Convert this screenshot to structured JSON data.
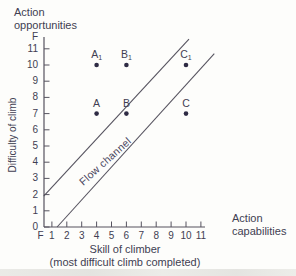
{
  "figure": {
    "top_label_line1": "Action",
    "top_label_line2": "opportunities",
    "right_label_line1": "Action",
    "right_label_line2": "capabilities",
    "y_axis_label": "Difficulty of climb",
    "x_axis_label_line1": "Skill of climber",
    "x_axis_label_line2": "(most difficult climb completed)"
  },
  "chart_data": {
    "type": "scatter",
    "title": "",
    "xlabel": "Skill of climber (most difficult climb completed)",
    "ylabel": "Difficulty of climb",
    "xlim": [
      0,
      12
    ],
    "ylim": [
      0,
      12
    ],
    "grid": false,
    "x_ticks": [
      "F",
      "1",
      "2",
      "3",
      "4",
      "5",
      "6",
      "7",
      "8",
      "9",
      "10",
      "11"
    ],
    "y_ticks": [
      "F",
      "11",
      "10",
      "9",
      "8",
      "7",
      "6",
      "5",
      "4",
      "3",
      "2",
      "1",
      "0"
    ],
    "points": [
      {
        "label": "A",
        "sub": "1",
        "x": 4,
        "y": 10
      },
      {
        "label": "B",
        "sub": "1",
        "x": 6,
        "y": 10
      },
      {
        "label": "C",
        "sub": "1",
        "x": 10,
        "y": 10
      },
      {
        "label": "A",
        "sub": "",
        "x": 4,
        "y": 7
      },
      {
        "label": "B",
        "sub": "",
        "x": 6,
        "y": 7
      },
      {
        "label": "C",
        "sub": "",
        "x": 10,
        "y": 7
      }
    ],
    "lines": [
      {
        "name": "flow-channel-upper-line",
        "x1": 0.45,
        "y1": 1.9,
        "x2": 10.2,
        "y2": 11.6
      },
      {
        "name": "flow-channel-lower-line",
        "x1": 1.35,
        "y1": 0,
        "x2": 11.9,
        "y2": 10.7
      }
    ],
    "annotation": {
      "text": "Flow channel",
      "x": 4.6,
      "y": 4.1,
      "rotation_deg": -42
    }
  },
  "colors": {
    "text": "#413e52",
    "axis": "#56535f",
    "channel_line": "#56535f",
    "dot": "#2e2b44",
    "background": "#fdfdfb",
    "bottom_band": "#e4e4e0"
  }
}
